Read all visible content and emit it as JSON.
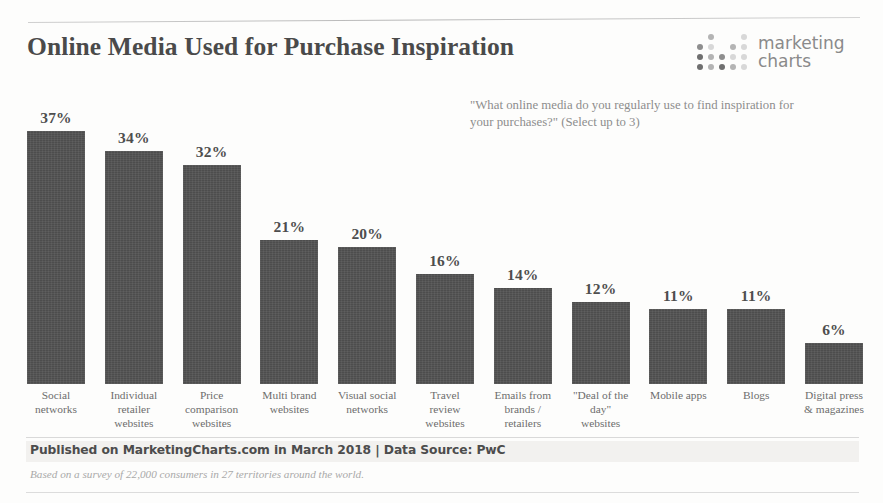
{
  "header": {
    "title": "Online Media Used for Purchase Inspiration",
    "logo": {
      "line1": "marketing",
      "line2": "charts",
      "icon": "dot-matrix-logo"
    }
  },
  "question": "\"What online media do you regularly use to find inspiration for your purchases?\" (Select up to 3)",
  "footer": {
    "published": "Published on MarketingCharts.com in March 2018 | Data Source: PwC",
    "note": "Based on a survey of 22,000 consumers in 27 territories around the world."
  },
  "colors": {
    "bar": "#4d4d4d",
    "title": "#4a4a4a",
    "label": "#6d6d6d",
    "question": "#8d8d8d",
    "footer_band": "#f2f1ef"
  },
  "chart_data": {
    "type": "bar",
    "title": "Online Media Used for Purchase Inspiration",
    "subtitle": "\"What online media do you regularly use to find inspiration for your purchases?\" (Select up to 3)",
    "xlabel": "",
    "ylabel": "",
    "ylim": [
      0,
      40
    ],
    "grid": false,
    "legend": "none",
    "unit": "%",
    "categories": [
      "Social networks",
      "Individual retailer websites",
      "Price comparison websites",
      "Multi brand websites",
      "Visual social networks",
      "Travel review websites",
      "Emails from brands / retailers",
      "\"Deal of the day\" websites",
      "Mobile apps",
      "Blogs",
      "Digital press & magazines"
    ],
    "category_lines": [
      [
        "Social",
        "networks"
      ],
      [
        "Individual",
        "retailer",
        "websites"
      ],
      [
        "Price",
        "comparison",
        "websites"
      ],
      [
        "Multi brand",
        "websites"
      ],
      [
        "Visual social",
        "networks"
      ],
      [
        "Travel",
        "review",
        "websites"
      ],
      [
        "Emails from",
        "brands /",
        "retailers"
      ],
      [
        "\"Deal of the",
        "day\"",
        "websites"
      ],
      [
        "Mobile apps"
      ],
      [
        "Blogs"
      ],
      [
        "Digital press",
        "& magazines"
      ]
    ],
    "values": [
      37,
      34,
      32,
      21,
      20,
      16,
      14,
      12,
      11,
      11,
      6
    ],
    "value_labels": [
      "37%",
      "34%",
      "32%",
      "21%",
      "20%",
      "16%",
      "14%",
      "12%",
      "11%",
      "11%",
      "6%"
    ]
  }
}
